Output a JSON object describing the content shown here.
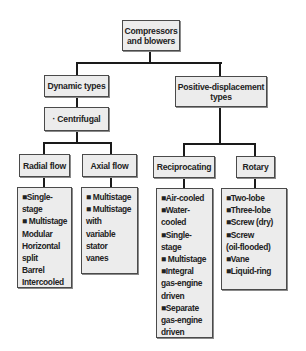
{
  "diagram": {
    "root": {
      "label": "Compressors\nand blowers"
    },
    "dynamic": {
      "label": "Dynamic types",
      "centrifugal": {
        "label": "· Centrifugal"
      },
      "radial": {
        "label": "Radial flow",
        "items": [
          "■Single-stage",
          "■ Multistage",
          "  Modular",
          "  Horizontal\n  split",
          "  Barrel",
          "  Intercooled"
        ]
      },
      "axial": {
        "label": "Axial flow",
        "items": [
          "■ Multistage",
          "■ Multistage\n  with\n  variable\n  stator\n  vanes"
        ]
      }
    },
    "positive": {
      "label": "Positive-displacement\ntypes",
      "reciprocating": {
        "label": "Reciprocating",
        "items": [
          "■Air-cooled",
          "■Water-\n  cooled",
          "■Single-stage",
          "■ Multistage",
          "■Integral\n  gas-engine\n  driven",
          "■Separate\n  gas-engine\n  driven"
        ]
      },
      "rotary": {
        "label": "Rotary",
        "items": [
          "■Two-lobe",
          "■Three-lobe",
          "■Screw (dry)",
          "■Screw\n  (oil-flooded)",
          "■Vane",
          "■Liquid-ring"
        ]
      }
    },
    "colors": {
      "box_fill": "#ececec",
      "box_border": "#4a4a4a",
      "connector": "#1a1a1a",
      "text": "#222222"
    }
  }
}
